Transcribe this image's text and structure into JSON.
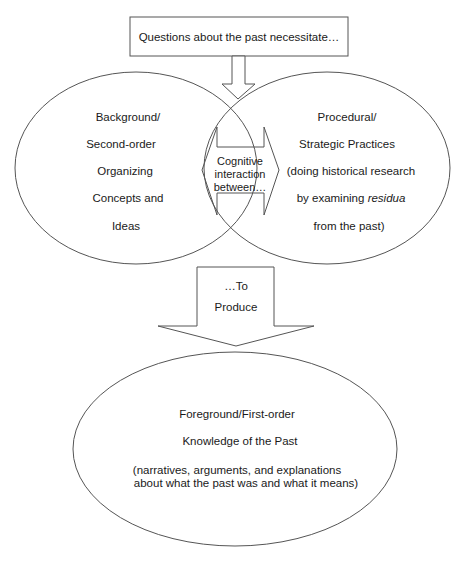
{
  "top_box": {
    "label": "Questions about the past necessitate…"
  },
  "left_circle": {
    "lines": [
      "Background/",
      "Second-order",
      "Organizing",
      "Concepts and",
      "Ideas"
    ]
  },
  "center_overlap": {
    "lines": [
      "Cognitive",
      "interaction",
      "between…"
    ]
  },
  "right_circle": {
    "lines": [
      "Procedural/",
      "Strategic Practices",
      "(doing historical research",
      "by examining ",
      "residua",
      "from the past)"
    ]
  },
  "produce_arrow": {
    "lines": [
      "…To",
      "Produce"
    ]
  },
  "bottom_ellipse": {
    "lines": [
      "Foreground/First-order",
      "Knowledge of the Past",
      "(narratives, arguments, and explanations",
      "about what the past was and what it means)"
    ]
  },
  "colors": {
    "stroke": "#555555",
    "text": "#1a1a1a",
    "background": "#ffffff"
  }
}
